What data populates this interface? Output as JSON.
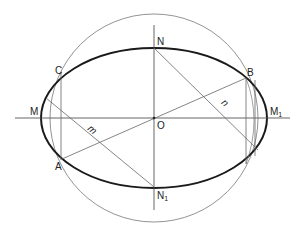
{
  "figure": {
    "colors": {
      "ellipse": "#1a1a1a",
      "circle": "#777777",
      "axis": "#555555",
      "construction": "#666666",
      "label": "#222222"
    },
    "center": {
      "x": 154,
      "y": 118
    },
    "ellipse": {
      "rx": 113,
      "ry": 70
    },
    "circle": {
      "r": 104
    },
    "labels": {
      "N": "N",
      "N1_base": "N",
      "N1_sub": "1",
      "M": "M",
      "M1_base": "M",
      "M1_sub": "1",
      "O": "O",
      "A": "A",
      "B": "B",
      "C": "C",
      "m": "m",
      "n": "n"
    }
  }
}
